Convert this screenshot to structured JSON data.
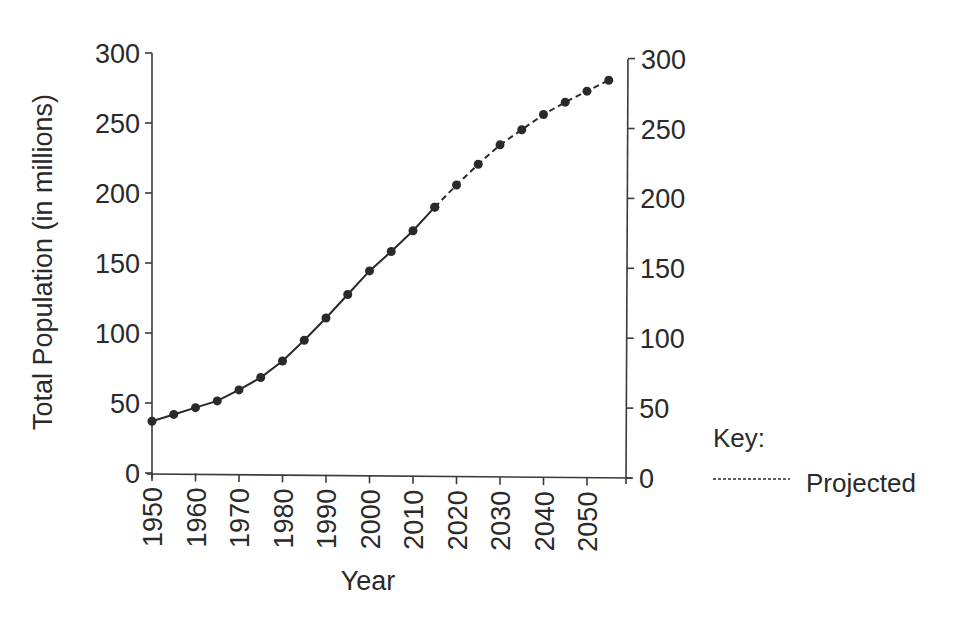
{
  "chart_data": {
    "type": "line",
    "title": "",
    "xlabel": "Year",
    "ylabel": "Total Population (in millions)",
    "ylabel_right": "",
    "xlim": [
      1950,
      2059
    ],
    "ylim": [
      0,
      300
    ],
    "grid": false,
    "x_ticks": [
      1950,
      1960,
      1970,
      1980,
      1990,
      2000,
      2010,
      2020,
      2030,
      2040,
      2050
    ],
    "y_ticks": [
      0,
      50,
      100,
      150,
      200,
      250,
      300
    ],
    "series": [
      {
        "name": "Actual",
        "style": "solid",
        "x": [
          1950,
          1955,
          1960,
          1965,
          1970,
          1975,
          1980,
          1985,
          1990,
          1995,
          2000,
          2005,
          2010,
          2015
        ],
        "values": [
          37,
          42,
          47,
          52,
          60,
          69,
          81,
          96,
          112,
          129,
          146,
          160,
          175,
          192
        ]
      },
      {
        "name": "Projected",
        "style": "dashed",
        "x": [
          2015,
          2020,
          2025,
          2030,
          2035,
          2040,
          2045,
          2050,
          2055
        ],
        "values": [
          192,
          208,
          223,
          237,
          248,
          259,
          268,
          276,
          284
        ]
      }
    ],
    "legend": {
      "title": "Key:",
      "position": "right",
      "entries": [
        {
          "label": "Projected",
          "style": "dashed"
        }
      ]
    }
  }
}
